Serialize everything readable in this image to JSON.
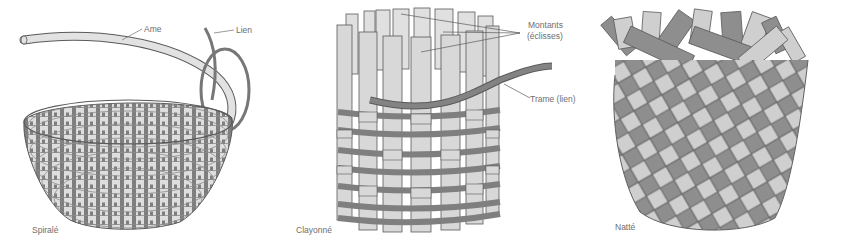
{
  "figure": {
    "colors": {
      "background": "#ffffff",
      "light_strip": "#d9d9d9",
      "dark_strip": "#858585",
      "outline": "#5a5a5a",
      "label_text": "#6e6e6e"
    },
    "panels": [
      {
        "id": "spirale",
        "caption": "Spiralé",
        "callouts": [
          {
            "label": "Ame"
          },
          {
            "label": "Lien"
          }
        ]
      },
      {
        "id": "clayonne",
        "caption": "Clayonné",
        "callouts": [
          {
            "label": "Montants",
            "label_line2": "(éclisses)"
          },
          {
            "label": "Trame (lien)"
          }
        ]
      },
      {
        "id": "natte",
        "caption": "Natté",
        "callouts": []
      }
    ]
  }
}
